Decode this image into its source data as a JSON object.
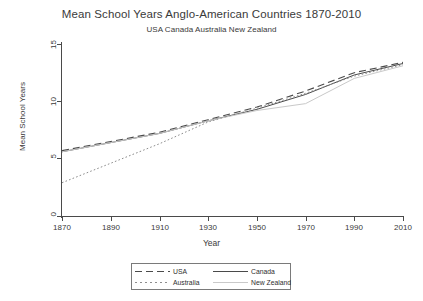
{
  "chart_data": {
    "type": "line",
    "title": "Mean School Years Anglo-American Countries 1870-2010",
    "subtitle": "USA Canada Australia New Zealand",
    "xlabel": "Year",
    "ylabel": "Mean School Years",
    "xlim": [
      1870,
      2010
    ],
    "ylim": [
      0,
      15
    ],
    "xticks": [
      1870,
      1890,
      1910,
      1930,
      1950,
      1970,
      1990,
      2010
    ],
    "yticks": [
      0,
      5,
      10,
      15
    ],
    "grid": false,
    "legend_position": "bottom-center",
    "x": [
      1870,
      1890,
      1910,
      1930,
      1950,
      1970,
      1990,
      2010
    ],
    "series": [
      {
        "name": "USA",
        "style": "long-dash",
        "color": "#4a4a4a",
        "values": [
          5.7,
          6.5,
          7.3,
          8.4,
          9.5,
          10.9,
          12.5,
          13.4
        ]
      },
      {
        "name": "Canada",
        "style": "solid",
        "color": "#4a4a4a",
        "values": [
          5.6,
          6.4,
          7.2,
          8.3,
          9.3,
          10.6,
          12.3,
          13.3
        ]
      },
      {
        "name": "Australia",
        "style": "dotted",
        "color": "#8d8d8d",
        "values": [
          2.9,
          4.6,
          6.3,
          8.2,
          9.4,
          10.7,
          12.2,
          13.2
        ]
      },
      {
        "name": "New Zealand",
        "style": "light-solid",
        "color": "#c9c9c9",
        "values": [
          5.6,
          6.4,
          7.2,
          8.3,
          9.2,
          9.8,
          12.0,
          13.1
        ]
      }
    ]
  },
  "legend": {
    "entries": [
      {
        "label": "USA",
        "key": "long-dash-key"
      },
      {
        "label": "Canada",
        "key": "solid-key"
      },
      {
        "label": "Australia",
        "key": "dotted-key"
      },
      {
        "label": "New Zealand",
        "key": "light-solid-key"
      }
    ]
  },
  "axis": {
    "ytick_labels": [
      "15",
      "10",
      "5",
      "0"
    ],
    "xtick_labels": [
      "1870",
      "1890",
      "1910",
      "1930",
      "1950",
      "1970",
      "1990",
      "2010"
    ]
  }
}
